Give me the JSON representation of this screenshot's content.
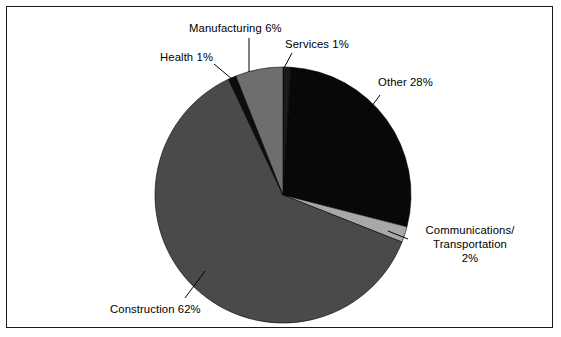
{
  "figure": {
    "background_color": "#ffffff",
    "border_color": "#1a1a1a"
  },
  "chart_data": {
    "type": "pie",
    "title": "",
    "subtitle": "",
    "xlabel": "",
    "ylabel": "",
    "grid": false,
    "legend_position": "none",
    "label_style": "category name followed by percentage, placed outside slice with leader line",
    "start_angle_deg": 0,
    "direction": "clockwise",
    "categories": [
      "Services",
      "Other",
      "Communications/Transportation",
      "Construction",
      "Health",
      "Manufacturing"
    ],
    "values": [
      1,
      28,
      2,
      62,
      1,
      6
    ],
    "unit": "%",
    "total": 100,
    "slices": [
      {
        "name": "Services",
        "value": 1,
        "label": "Services 1%",
        "color": "#1a1a1a",
        "start_deg": 0,
        "end_deg": 3.6
      },
      {
        "name": "Other",
        "value": 28,
        "label": "Other 28%",
        "color": "#080808",
        "start_deg": 3.6,
        "end_deg": 104.4
      },
      {
        "name": "Communications/Transportation",
        "value": 2,
        "label_line1": "Communications/",
        "label_line2": "Transportation",
        "label_line3": "2%",
        "color": "#a8a8a8",
        "start_deg": 104.4,
        "end_deg": 111.6
      },
      {
        "name": "Construction",
        "value": 62,
        "label": "Construction 62%",
        "color": "#4a4a4a",
        "start_deg": 111.6,
        "end_deg": 334.8
      },
      {
        "name": "Health",
        "value": 1,
        "label": "Health 1%",
        "color": "#0d0d0d",
        "start_deg": 334.8,
        "end_deg": 338.4
      },
      {
        "name": "Manufacturing",
        "value": 6,
        "label": "Manufacturing 6%",
        "color": "#6e6e6e",
        "start_deg": 338.4,
        "end_deg": 360
      }
    ]
  },
  "labels": {
    "manufacturing": "Manufacturing 6%",
    "health": "Health 1%",
    "services": "Services 1%",
    "other": "Other 28%",
    "commtrans_line1": "Communications/",
    "commtrans_line2": "Transportation",
    "commtrans_line3": "2%",
    "construction": "Construction 62%"
  }
}
